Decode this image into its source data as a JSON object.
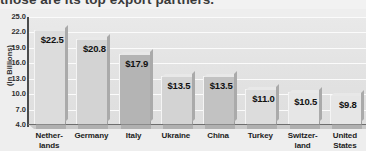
{
  "caption": "those are its top export partners.",
  "chart_data": {
    "type": "bar",
    "title": "",
    "xlabel": "",
    "ylabel": "(in Billions)",
    "ylim": [
      4.0,
      25.0
    ],
    "grid": true,
    "legend": "none",
    "yticks": [
      "25.0",
      "22.0",
      "19.0",
      "16.0",
      "13.0",
      "10.0",
      "7.0",
      "4.0"
    ],
    "ytick_values": [
      25.0,
      22.0,
      19.0,
      16.0,
      13.0,
      10.0,
      7.0,
      4.0
    ],
    "categories": [
      "Netherlands",
      "Germany",
      "Italy",
      "Ukraine",
      "China",
      "Turkey",
      "Switzerland",
      "United States"
    ],
    "category_lines": [
      [
        "Nether-",
        "lands"
      ],
      [
        "Germany",
        ""
      ],
      [
        "Italy",
        ""
      ],
      [
        "Ukraine",
        ""
      ],
      [
        "China",
        ""
      ],
      [
        "Turkey",
        ""
      ],
      [
        "Switzer-",
        "land"
      ],
      [
        "United",
        "States"
      ]
    ],
    "values": [
      22.5,
      20.8,
      17.9,
      13.5,
      13.5,
      11.0,
      10.5,
      9.8
    ],
    "value_labels": [
      "$22.5",
      "$20.8",
      "$17.9",
      "$13.5",
      "$13.5",
      "$11.0",
      "$10.5",
      "$9.8"
    ],
    "bar_tones": [
      "light",
      "default",
      "darker",
      "default",
      "dark",
      "light",
      "lightest",
      "lightest"
    ],
    "colors": {
      "plot_background": "#e4e4e4",
      "page_background": "#eeeeee",
      "gridline": "#fbfbfb",
      "axis": "#4c4c4c",
      "bar_default": "#d3d3d3",
      "bar_dark": "#c2c2c2",
      "bar_darker": "#b4b4b4",
      "bar_light": "#dcdcdc",
      "bar_lightest": "#e6e6e6",
      "label_text": "#111111"
    }
  }
}
